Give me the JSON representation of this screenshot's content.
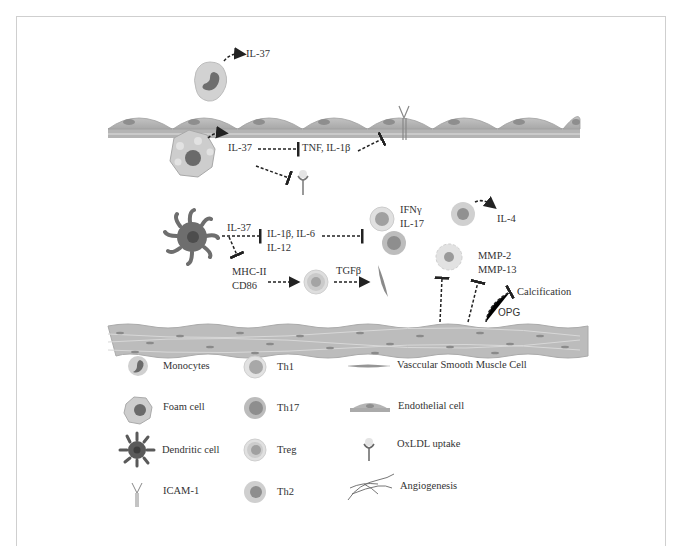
{
  "figure": {
    "labels": {
      "monocyte_il37": "IL-37",
      "foam_il37": "IL-37",
      "foam_targets": "TNF, IL-1β",
      "dc_il37": "IL-37",
      "dc_targets_line1": "IL-1β, IL-6",
      "dc_targets_line2": "IL-12",
      "th_cytokines_line1": "IFNγ",
      "th_cytokines_line2": "IL-17",
      "th2_il4": "IL-4",
      "mhc_line1": "MHC-II",
      "mhc_line2": "CD86",
      "tgfb": "TGFβ",
      "mmp_line1": "MMP-2",
      "mmp_line2": "MMP-13",
      "calcification": "Calcification",
      "opg": "OPG"
    },
    "colors": {
      "border": "#cfcfcf",
      "cell_light": "#d4d4d4",
      "cell_mid": "#b0b0b0",
      "cell_dark": "#7a7a7a",
      "cell_darkest": "#4f4f4f",
      "arrow": "#222222"
    }
  },
  "legend": {
    "items": [
      {
        "icon": "monocyte-icon",
        "label": "Monocytes"
      },
      {
        "icon": "foam-cell-icon",
        "label": "Foam cell"
      },
      {
        "icon": "dendritic-cell-icon",
        "label": "Dendritic cell"
      },
      {
        "icon": "icam1-icon",
        "label": "ICAM-1"
      },
      {
        "icon": "th1-icon",
        "label": "Th1"
      },
      {
        "icon": "th17-icon",
        "label": "Th17"
      },
      {
        "icon": "treg-icon",
        "label": "Treg"
      },
      {
        "icon": "th2-icon",
        "label": "Th2"
      },
      {
        "icon": "vsmc-icon",
        "label": "Vasccular Smooth Muscle Cell"
      },
      {
        "icon": "endothelial-cell-icon",
        "label": "Endothelial cell"
      },
      {
        "icon": "oxldl-uptake-icon",
        "label": "OxLDL uptake"
      },
      {
        "icon": "angiogenesis-icon",
        "label": "Angiogenesis"
      }
    ]
  }
}
